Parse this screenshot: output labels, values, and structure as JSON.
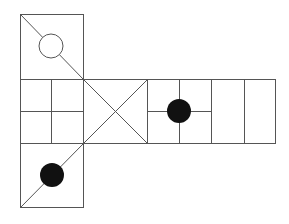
{
  "diagram": {
    "type": "cube-net",
    "stroke_color": "#555555",
    "fill_color": "#111111",
    "background": "#ffffff",
    "faces": [
      {
        "id": "top",
        "x": 20,
        "y": 14,
        "size": 64,
        "marking": "diagonal top-left to bottom-right with open circle on diagonal",
        "circle": {
          "cx": 51,
          "cy": 46,
          "r": 12,
          "filled": false
        }
      },
      {
        "id": "middle-left",
        "x": 20,
        "y": 79,
        "size": 64,
        "marking": "2x2 grid"
      },
      {
        "id": "middle-x",
        "x": 83,
        "y": 79,
        "size": 64,
        "marking": "X diagonals"
      },
      {
        "id": "middle-dot",
        "x": 147,
        "y": 79,
        "size": 64,
        "marking": "cross lines with filled circle at center",
        "circle": {
          "cx": 179,
          "cy": 111,
          "r": 12,
          "filled": true
        }
      },
      {
        "id": "middle-right",
        "x": 211,
        "y": 79,
        "size": 64,
        "marking": "single vertical divider"
      },
      {
        "id": "bottom",
        "x": 20,
        "y": 143,
        "size": 64,
        "marking": "diagonal bottom-left to top-right with filled circle on diagonal",
        "circle": {
          "cx": 52,
          "cy": 175,
          "r": 12,
          "filled": true
        }
      }
    ]
  }
}
